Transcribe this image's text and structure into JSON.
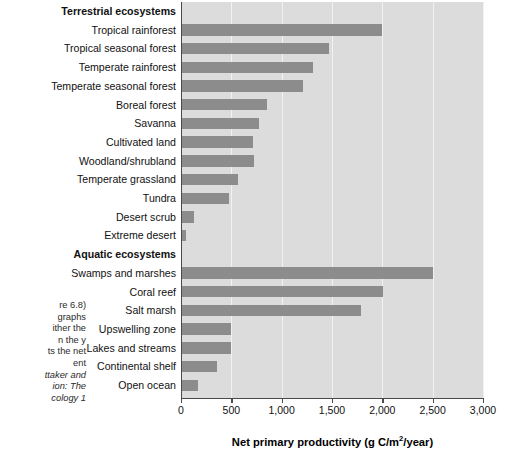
{
  "caption": {
    "lines": [
      {
        "text": "re 6.8)",
        "italic": false
      },
      {
        "text": "graphs",
        "italic": false
      },
      {
        "text": "ither the",
        "italic": false
      },
      {
        "text": "n the y",
        "italic": false
      },
      {
        "text": "ts the net",
        "italic": false
      },
      {
        "text": "ent",
        "italic": false
      },
      {
        "text": "ttaker and",
        "italic": true
      },
      {
        "text": "ion: The",
        "italic": true
      },
      {
        "text": "cology 1",
        "italic": true
      }
    ]
  },
  "chart_data": {
    "type": "bar",
    "orientation": "horizontal",
    "title": "",
    "xlabel": "Net primary productivity (g C/m2/year)",
    "xlabel_prefix": "Net primary productivity (g C/m",
    "xlabel_sup": "2",
    "xlabel_suffix": "/year)",
    "ylabel": "",
    "xlim": [
      0,
      3000
    ],
    "xticks": [
      0,
      500,
      1000,
      1500,
      2000,
      2500,
      3000
    ],
    "xticklabels": [
      "0",
      "500",
      "1,000",
      "1,500",
      "2,000",
      "2,500",
      "3,000"
    ],
    "grid": true,
    "legend": "none",
    "bar_color": "#8c8c8c",
    "plot_background": "#dcdcdc",
    "gridline_color": "#f2f2f2",
    "axis_color": "#4a4a4a",
    "rows": [
      {
        "label": "Terrestrial ecosystems",
        "group": true,
        "value": null
      },
      {
        "label": "Tropical rainforest",
        "group": false,
        "value": 2000
      },
      {
        "label": "Tropical seasonal forest",
        "group": false,
        "value": 1470
      },
      {
        "label": "Temperate rainforest",
        "group": false,
        "value": 1310
      },
      {
        "label": "Temperate seasonal forest",
        "group": false,
        "value": 1210
      },
      {
        "label": "Boreal forest",
        "group": false,
        "value": 850
      },
      {
        "label": "Savanna",
        "group": false,
        "value": 775
      },
      {
        "label": "Cultivated land",
        "group": false,
        "value": 715
      },
      {
        "label": "Woodland/shrubland",
        "group": false,
        "value": 725
      },
      {
        "label": "Temperate grassland",
        "group": false,
        "value": 565
      },
      {
        "label": "Tundra",
        "group": false,
        "value": 480
      },
      {
        "label": "Desert scrub",
        "group": false,
        "value": 125
      },
      {
        "label": "Extreme desert",
        "group": false,
        "value": 45
      },
      {
        "label": "Aquatic ecosystems",
        "group": true,
        "value": null
      },
      {
        "label": "Swamps and marshes",
        "group": false,
        "value": 2500
      },
      {
        "label": "Coral reef",
        "group": false,
        "value": 2010
      },
      {
        "label": "Salt marsh",
        "group": false,
        "value": 1790
      },
      {
        "label": "Upswelling zone",
        "group": false,
        "value": 500
      },
      {
        "label": "Lakes and streams",
        "group": false,
        "value": 500
      },
      {
        "label": "Continental shelf",
        "group": false,
        "value": 360
      },
      {
        "label": "Open ocean",
        "group": false,
        "value": 170
      }
    ]
  }
}
